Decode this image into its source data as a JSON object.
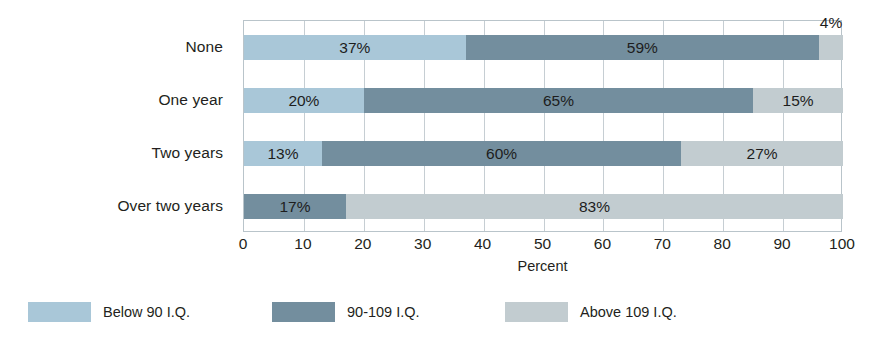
{
  "chart_data": {
    "type": "bar",
    "orientation": "horizontal",
    "stacked": true,
    "title": "",
    "xlabel": "Percent",
    "ylabel": "",
    "xlim": [
      0,
      100
    ],
    "xticks": [
      0,
      10,
      20,
      30,
      40,
      50,
      60,
      70,
      80,
      90,
      100
    ],
    "xtick_labels": [
      "0",
      "10",
      "20",
      "30",
      "40",
      "50",
      "60",
      "70",
      "80",
      "90",
      "100"
    ],
    "grid": true,
    "legend_position": "bottom",
    "categories": [
      "None",
      "One year",
      "Two years",
      "Over two years"
    ],
    "series": [
      {
        "name": "Below 90 I.Q.",
        "color": "#a9c7d8",
        "values": [
          37,
          20,
          13,
          0
        ],
        "labels": [
          "37%",
          "20%",
          "13%",
          ""
        ]
      },
      {
        "name": "90-109 I.Q.",
        "color": "#738e9e",
        "values": [
          59,
          65,
          60,
          17
        ],
        "labels": [
          "59%",
          "65%",
          "60%",
          "17%"
        ]
      },
      {
        "name": "Above 109 I.Q.",
        "color": "#c2ccd0",
        "values": [
          4,
          15,
          27,
          83
        ],
        "labels": [
          "4%",
          "15%",
          "27%",
          "83%"
        ]
      }
    ],
    "rows": [
      {
        "category": "None",
        "segments": [
          {
            "series": "Below 90 I.Q.",
            "value": 37,
            "label": "37%",
            "color": "#a9c7d8",
            "label_outside": false
          },
          {
            "series": "90-109 I.Q.",
            "value": 59,
            "label": "59%",
            "color": "#738e9e",
            "label_outside": false
          },
          {
            "series": "Above 109 I.Q.",
            "value": 4,
            "label": "4%",
            "color": "#c2ccd0",
            "label_outside": true
          }
        ]
      },
      {
        "category": "One year",
        "segments": [
          {
            "series": "Below 90 I.Q.",
            "value": 20,
            "label": "20%",
            "color": "#a9c7d8",
            "label_outside": false
          },
          {
            "series": "90-109 I.Q.",
            "value": 65,
            "label": "65%",
            "color": "#738e9e",
            "label_outside": false
          },
          {
            "series": "Above 109 I.Q.",
            "value": 15,
            "label": "15%",
            "color": "#c2ccd0",
            "label_outside": false
          }
        ]
      },
      {
        "category": "Two years",
        "segments": [
          {
            "series": "Below 90 I.Q.",
            "value": 13,
            "label": "13%",
            "color": "#a9c7d8",
            "label_outside": false
          },
          {
            "series": "90-109 I.Q.",
            "value": 60,
            "label": "60%",
            "color": "#738e9e",
            "label_outside": false
          },
          {
            "series": "Above 109 I.Q.",
            "value": 27,
            "label": "27%",
            "color": "#c2ccd0",
            "label_outside": false
          }
        ]
      },
      {
        "category": "Over two years",
        "segments": [
          {
            "series": "90-109 I.Q.",
            "value": 17,
            "label": "17%",
            "color": "#738e9e",
            "label_outside": false
          },
          {
            "series": "Above 109 I.Q.",
            "value": 83,
            "label": "83%",
            "color": "#c2ccd0",
            "label_outside": false
          }
        ]
      }
    ]
  },
  "legend": {
    "items": [
      {
        "label": "Below 90 I.Q.",
        "color": "#a9c7d8"
      },
      {
        "label": "90-109 I.Q.",
        "color": "#738e9e"
      },
      {
        "label": "Above 109 I.Q.",
        "color": "#c2ccd0"
      }
    ]
  },
  "axis": {
    "x_title": "Percent"
  },
  "caption_sliver": ""
}
